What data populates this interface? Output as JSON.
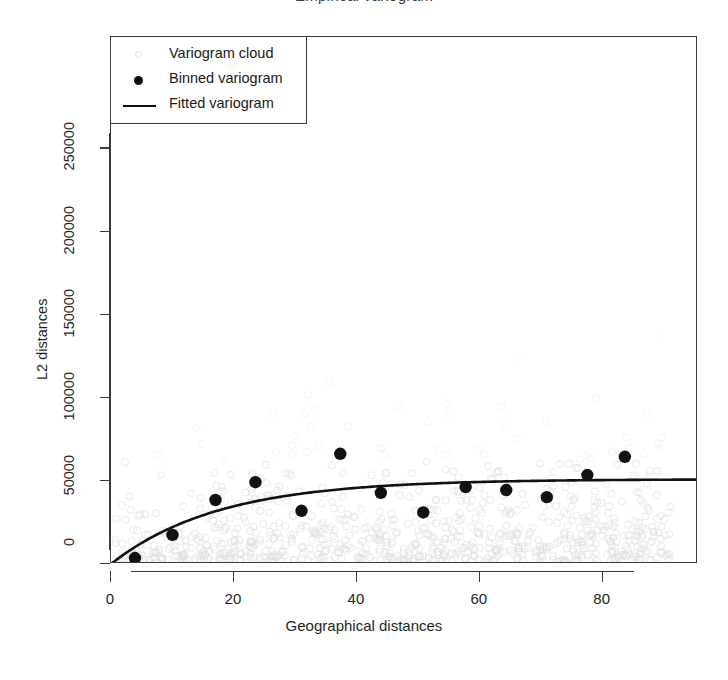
{
  "chart_data": {
    "type": "scatter",
    "title": "Empirical variogram",
    "xlabel": "Geographical distances",
    "ylabel": "L2 distances",
    "xlim": [
      0,
      95.5
    ],
    "ylim": [
      0,
      317000
    ],
    "xticks": [
      0,
      20,
      40,
      60,
      80
    ],
    "yticks": [
      0,
      50000,
      100000,
      150000,
      200000,
      250000
    ],
    "xtick_labels": [
      "0",
      "20",
      "40",
      "60",
      "80"
    ],
    "ytick_labels": [
      "0",
      "50000",
      "100000",
      "150000",
      "200000",
      "250000"
    ],
    "grid": false,
    "legend_position": "top-left",
    "legend": [
      {
        "label": "Variogram cloud",
        "marker": "open-circle",
        "color": "#e2e2e2"
      },
      {
        "label": "Binned variogram",
        "marker": "filled-circle",
        "color": "#111111"
      },
      {
        "label": "Fitted variogram",
        "marker": "line",
        "color": "#111111"
      }
    ],
    "series": [
      {
        "name": "Binned variogram",
        "marker": "filled-circle",
        "color": "#111111",
        "x": [
          3.9,
          10.0,
          17.0,
          23.5,
          31.0,
          37.3,
          43.9,
          50.8,
          57.7,
          64.3,
          70.9,
          77.5,
          83.6
        ],
        "y": [
          3600,
          17500,
          38500,
          49200,
          32000,
          66300,
          42800,
          31000,
          46300,
          44500,
          40200,
          53500,
          64500
        ]
      },
      {
        "name": "Fitted variogram",
        "marker": "line",
        "color": "#111111",
        "model": "exponential",
        "nugget": 0,
        "sill": 51000,
        "range": 17.5
      },
      {
        "name": "Variogram cloud",
        "marker": "open-circle",
        "color": "#dcdcdc",
        "n_points": 900,
        "description": "dense light grey open circles concentrated below 60000, thinning upward to ~260000"
      }
    ]
  }
}
